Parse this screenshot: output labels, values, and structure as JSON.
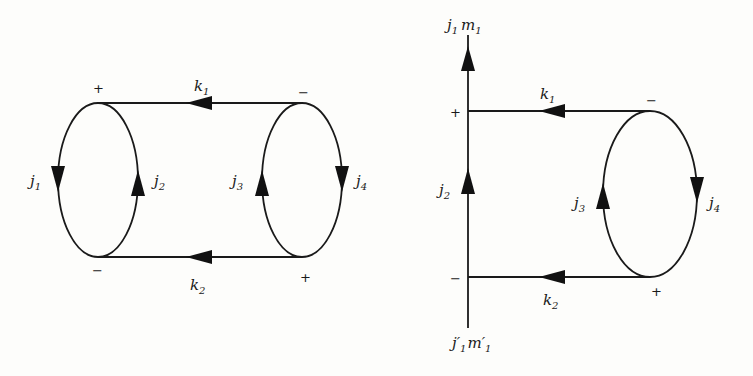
{
  "diagrams": [
    {
      "name": "closed-diagram",
      "lines": {
        "k1": {
          "label": "k",
          "sub": "1"
        },
        "k2": {
          "label": "k",
          "sub": "2"
        },
        "j1": {
          "label": "j",
          "sub": "1"
        },
        "j2": {
          "label": "j",
          "sub": "2"
        },
        "j3": {
          "label": "j",
          "sub": "3"
        },
        "j4": {
          "label": "j",
          "sub": "4"
        }
      },
      "signs": {
        "top_left": "+",
        "top_right": "−",
        "bottom_left": "−",
        "bottom_right": "+"
      }
    },
    {
      "name": "open-diagram",
      "lines": {
        "top_end": {
          "label": "j",
          "sub": "1",
          "label2": "m",
          "sub2": "1"
        },
        "bottom_end": {
          "label": "j′",
          "sub": "1",
          "label2": "m′",
          "sub2": "1"
        },
        "k1": {
          "label": "k",
          "sub": "1"
        },
        "k2": {
          "label": "k",
          "sub": "2"
        },
        "j2": {
          "label": "j",
          "sub": "2"
        },
        "j3": {
          "label": "j",
          "sub": "3"
        },
        "j4": {
          "label": "j",
          "sub": "4"
        }
      },
      "signs": {
        "top_left": "+",
        "top_right": "−",
        "bottom_left": "−",
        "bottom_right": "+"
      }
    }
  ]
}
